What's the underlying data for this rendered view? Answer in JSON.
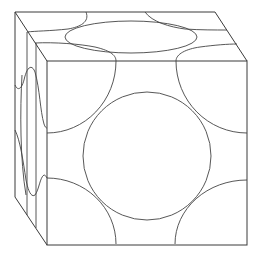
{
  "diagram": {
    "stroke_color": "#3a3a3a",
    "background": "#ffffff",
    "cube": {
      "front_face": {
        "x": 47,
        "y": 61,
        "width": 200,
        "height": 183
      },
      "back_top_edge": [
        [
          15,
          12
        ],
        [
          215,
          12
        ]
      ],
      "back_left_edge": [
        [
          15,
          12
        ],
        [
          15,
          197
        ]
      ]
    },
    "front_face_spheres": {
      "center_sphere": {
        "cx": 147,
        "cy": 156,
        "r": 64
      },
      "corner_arcs": [
        "top-left",
        "top-right",
        "bottom-left",
        "bottom-right"
      ]
    },
    "top_face_spheres": {
      "center_ellipse": {
        "cx": 131,
        "cy": 37,
        "rx": 66,
        "ry": 16
      }
    },
    "left_face_spheres": {
      "center_ellipse": {
        "cx": 28,
        "cy": 130,
        "rx": 10,
        "ry": 62
      }
    }
  }
}
